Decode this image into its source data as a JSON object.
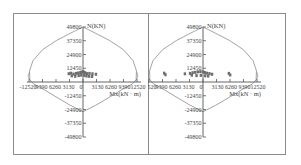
{
  "chart_data": [
    {
      "type": "scatter",
      "title": "",
      "panel": "left",
      "xlabel": "Mx(kN · m)",
      "ylabel": "N(KN)",
      "x_ticks": [
        -12520,
        -9390,
        -6260,
        -3130,
        0,
        3130,
        6260,
        9390,
        12520
      ],
      "x_tick_labels": [
        "-12520",
        "9390",
        "6260",
        "3130",
        "0",
        "3130",
        "6260",
        "9390",
        "12520"
      ],
      "y_ticks": [
        49800,
        37350,
        24900,
        12450,
        -12450,
        -24900,
        -37350,
        -49800
      ],
      "y_tick_labels": [
        "49800",
        "37350",
        "24900",
        "12450",
        "-12450",
        "-24900",
        "-37350",
        "-49800"
      ],
      "xlim": [
        -12520,
        12520
      ],
      "ylim": [
        -49800,
        49800
      ],
      "grid": false,
      "interaction_envelope": {
        "x": [
          0,
          -3000,
          -6200,
          -9300,
          -11600,
          -12400,
          -12300,
          -11500,
          -9000,
          -6000,
          -3000,
          0,
          3000,
          6000,
          9000,
          11500,
          12300,
          12400,
          11600,
          9300,
          6200,
          3000,
          0
        ],
        "y": [
          49800,
          44000,
          37500,
          29500,
          19500,
          10000,
          2000,
          -1500,
          -7000,
          -14000,
          -21000,
          -27000,
          -21000,
          -14000,
          -7000,
          -1500,
          2000,
          10000,
          19500,
          29500,
          37500,
          44000,
          49800
        ]
      },
      "points": {
        "x": [
          -3300,
          -2800,
          -2200,
          -1600,
          -1100,
          -600,
          -300,
          0,
          200,
          500,
          900,
          1500,
          2200,
          3000,
          -2600,
          -1800,
          -1000,
          -400,
          300,
          800,
          1400,
          2100
        ],
        "y": [
          7500,
          8000,
          7200,
          7800,
          8200,
          8600,
          9000,
          9400,
          8800,
          8400,
          7600,
          7800,
          7400,
          7000,
          5600,
          5200,
          5800,
          6200,
          6000,
          5400,
          5200,
          5000
        ]
      }
    },
    {
      "type": "scatter",
      "title": "",
      "panel": "right",
      "xlabel": "Mx(kN · m)",
      "ylabel": "N(KN)",
      "x_ticks": [
        -12520,
        -9390,
        -6260,
        -3130,
        0,
        3130,
        6260,
        9390,
        12520
      ],
      "x_tick_labels": [
        "-12520",
        "9390",
        "6260",
        "3130",
        "0",
        "3130",
        "6260",
        "9390",
        "12520"
      ],
      "y_ticks": [
        49800,
        37350,
        24900,
        12450,
        -12450,
        -24900,
        -37350,
        -49800
      ],
      "y_tick_labels": [
        "49800",
        "37350",
        "24900",
        "12450",
        "-12450",
        "-24900",
        "-37350",
        "-49800"
      ],
      "xlim": [
        -12520,
        12520
      ],
      "ylim": [
        -49800,
        49800
      ],
      "grid": false,
      "interaction_envelope": {
        "x": [
          0,
          -3000,
          -6200,
          -9300,
          -11600,
          -12400,
          -12300,
          -11500,
          -9000,
          -6000,
          -3000,
          0,
          3000,
          6000,
          9000,
          11500,
          12300,
          12400,
          11600,
          9300,
          6200,
          3000,
          0
        ],
        "y": [
          49800,
          44000,
          37500,
          29500,
          19500,
          10000,
          2000,
          -1500,
          -7000,
          -14000,
          -21000,
          -27000,
          -21000,
          -14000,
          -7000,
          -1500,
          2000,
          10000,
          19500,
          29500,
          37500,
          44000,
          49800
        ]
      },
      "points": {
        "x": [
          -9000,
          -8700,
          -4200,
          -3000,
          -2400,
          -1800,
          -1200,
          -600,
          0,
          400,
          900,
          1500,
          2100,
          6000,
          6300,
          -2600,
          -1500,
          -500,
          500,
          1200
        ],
        "y": [
          8000,
          6600,
          7400,
          7800,
          8400,
          8800,
          9200,
          9400,
          9200,
          8600,
          8000,
          7600,
          7000,
          7800,
          6400,
          6200,
          5800,
          6000,
          5600,
          5400
        ]
      }
    }
  ],
  "panels": [
    {
      "ylabel": "N(KN)",
      "xlabel": "Mx(kN · m)",
      "origin_label": "0"
    },
    {
      "ylabel": "N(KN)",
      "xlabel": "Mx(kN · m)",
      "origin_label": "0"
    }
  ],
  "colors": {
    "axis": "#555555",
    "envelope": "#8c8c8c",
    "points": "#6e6e6e",
    "frame": "#8a8a8a"
  }
}
